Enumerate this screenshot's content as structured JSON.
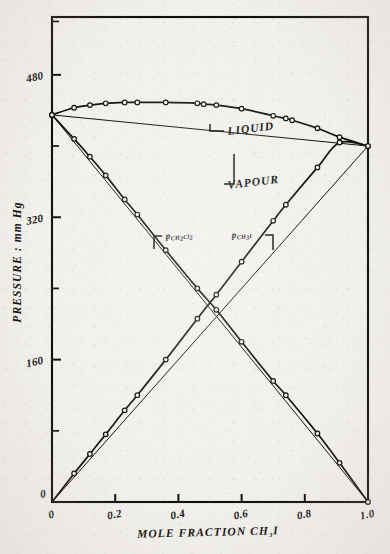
{
  "figure": {
    "caption_present": false,
    "background_color": "#f2f0ec",
    "ink_color": "#100e0c"
  },
  "axes": {
    "x_title": "MOLE FRACTION CH",
    "x_title_sub": "3",
    "x_title_tail": "I",
    "y_title": "PRESSURE : mm Hg",
    "x_ticks": [
      "0",
      "0.2",
      "0.4",
      "0.6",
      "0.8",
      "1.0"
    ],
    "x_tick_values": [
      0,
      0.2,
      0.4,
      0.6,
      0.8,
      1.0
    ],
    "y_ticks": [
      "0",
      "160",
      "320",
      "480"
    ],
    "y_tick_values": [
      0,
      160,
      320,
      480
    ],
    "y_minor_tick_values": [
      80,
      240,
      400,
      540
    ],
    "origin_label": "0"
  },
  "annotations": {
    "liquid": "LIQUID",
    "vapour": "VAPOUR",
    "p_ch2cl2_main": "p",
    "p_ch2cl2_sub1": "CH",
    "p_ch2cl2_sub2": "2",
    "p_ch2cl2_sub3": "Cl",
    "p_ch2cl2_sub4": "2",
    "p_ch3i_main": "p",
    "p_ch3i_sub1": "CH",
    "p_ch3i_sub2": "3",
    "p_ch3i_sub3": "I"
  },
  "chart_data": {
    "type": "line",
    "title": "",
    "xlabel": "MOLE FRACTION CH3I",
    "ylabel": "PRESSURE : mm Hg",
    "xlim": [
      0,
      1.0
    ],
    "ylim": [
      0,
      545
    ],
    "grid": false,
    "legend": "inline-annotations",
    "marker": "open-circle",
    "series": [
      {
        "name": "LIQUID",
        "description": "Total pressure vs liquid mole fraction CH3I (bubble-point curve)",
        "x": [
          0.0,
          0.07,
          0.12,
          0.17,
          0.23,
          0.27,
          0.36,
          0.46,
          0.48,
          0.52,
          0.6,
          0.7,
          0.74,
          0.76,
          0.84,
          0.91,
          1.0
        ],
        "y": [
          435,
          443,
          446,
          448,
          449,
          449,
          449,
          448,
          447,
          446,
          442,
          434,
          431,
          429,
          420,
          410,
          400
        ]
      },
      {
        "name": "VAPOUR",
        "description": "Total pressure vs vapour mole fraction CH3I (dew-point curve)",
        "x": [
          0.0,
          0.2,
          0.4,
          0.6,
          0.8,
          1.0
        ],
        "y": [
          435,
          428,
          421,
          414,
          407,
          400
        ]
      },
      {
        "name": "p_CH2Cl2",
        "description": "Partial pressure of dichloromethane, measured points",
        "x": [
          0.0,
          0.07,
          0.12,
          0.17,
          0.23,
          0.27,
          0.36,
          0.46,
          0.52,
          0.6,
          0.7,
          0.74,
          0.84,
          0.91,
          1.0
        ],
        "y": [
          435,
          408,
          388,
          367,
          340,
          323,
          283,
          240,
          216,
          180,
          136,
          120,
          77,
          44,
          0
        ]
      },
      {
        "name": "p_CH2Cl2_raoult",
        "description": "Raoult's law reference line for dichloromethane",
        "x": [
          0.0,
          1.0
        ],
        "y": [
          435,
          0
        ]
      },
      {
        "name": "p_CH3I",
        "description": "Partial pressure of methyl iodide, measured points",
        "x": [
          0.0,
          0.07,
          0.12,
          0.17,
          0.23,
          0.27,
          0.36,
          0.46,
          0.52,
          0.6,
          0.7,
          0.74,
          0.84,
          0.91,
          1.0
        ],
        "y": [
          0,
          32,
          54,
          76,
          103,
          120,
          160,
          206,
          233,
          270,
          316,
          334,
          376,
          404,
          400
        ]
      },
      {
        "name": "p_CH3I_raoult",
        "description": "Raoult's law reference line for methyl iodide",
        "x": [
          0.0,
          1.0
        ],
        "y": [
          0,
          400
        ]
      }
    ],
    "notes": {
      "pure_ch2cl2_pressure": 435,
      "pure_ch3i_pressure": 400,
      "crossover_x": 0.51,
      "crossover_y": 215
    }
  }
}
